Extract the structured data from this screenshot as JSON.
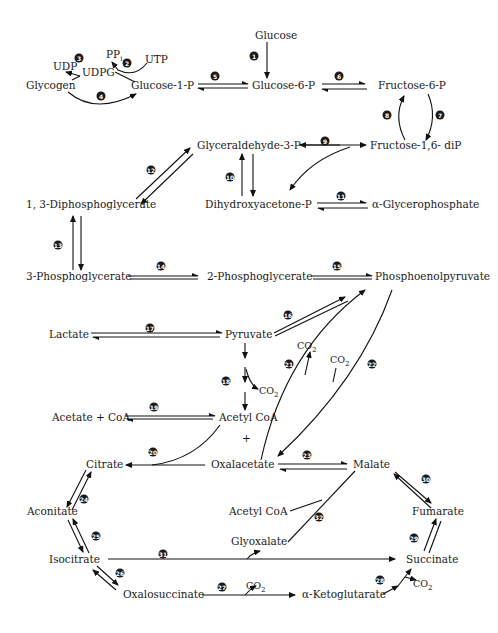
{
  "diagram": {
    "type": "metabolic-pathway",
    "nodes": {
      "glucose": "Glucose",
      "ppi": "PP",
      "ppi_sub": "i",
      "utp": "UTP",
      "udp": "UDP",
      "udpg": "UDPG",
      "glycogen": "Glycogen",
      "glucose_1_p": "Glucose-1-P",
      "glucose_6_p": "Glucose-6-P",
      "fructose_6_p": "Fructose-6-P",
      "fructose_1_6_dip": "Fructose-1,6- diP",
      "glyceraldehyde_3_p": "Glyceraldehyde-3-P",
      "dihydroxyacetone_p": "Dihydroxyacetone-P",
      "alpha_glycerophosphate": "α-Glycerophosphate",
      "diphosphoglycerate_1_3": "1, 3-Diphosphoglycerate",
      "phosphoglycerate_3": "3-Phosphoglycerate",
      "phosphoglycerate_2": "2-Phosphoglycerate",
      "phosphoenolpyruvate": "Phosphoenolpyruvate",
      "lactate": "Lactate",
      "pyruvate": "Pyruvate",
      "co2_a": "CO",
      "co2_b": "CO",
      "co2_c": "CO",
      "co2_d": "CO",
      "co2_e": "CO",
      "co2_sub": "2",
      "acetate_coa": "Acetate + CoA",
      "acetyl_coa": "Acetyl CoA",
      "plus": "+",
      "oxalacetate": "Oxalacetate",
      "citrate": "Citrate",
      "malate": "Malate",
      "aconitate": "Aconitate",
      "acetyl_coa_2": "Acetyl CoA",
      "fumarate": "Fumarate",
      "glyoxalate": "Glyoxalate",
      "isocitrate": "Isocitrate",
      "succinate": "Succinate",
      "oxalosuccinate": "Oxalosuccinate",
      "alpha_ketoglutarate": "α-Ketoglutarate"
    },
    "steps": [
      "1",
      "2",
      "3",
      "4",
      "5",
      "6",
      "7",
      "8",
      "9",
      "10",
      "11",
      "12",
      "13",
      "14",
      "15",
      "16",
      "17",
      "18",
      "19",
      "20",
      "21",
      "22",
      "23",
      "24",
      "25",
      "26",
      "27",
      "28",
      "29",
      "30",
      "31",
      "32"
    ],
    "colors": {
      "ink": "#111111",
      "background": "#ffffff",
      "step_marker": "#1a1a1a"
    }
  }
}
